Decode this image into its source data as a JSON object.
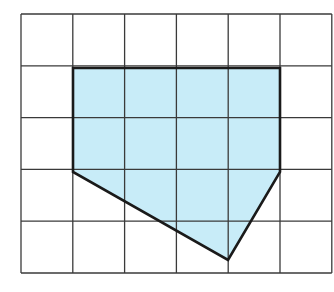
{
  "diagram": {
    "type": "grid-polygon",
    "grid": {
      "columns": 6,
      "rows": 5,
      "origin_px": [
        21,
        14
      ],
      "cell_px": 51.8,
      "line_color": "#3a3a3a",
      "background": "#ffffff"
    },
    "polygon": {
      "fill": "#c8ecf8",
      "stroke": "#1a1a1a",
      "vertices_grid": [
        [
          1,
          1
        ],
        [
          5,
          1
        ],
        [
          5,
          3
        ],
        [
          4,
          4.65
        ],
        [
          1,
          3
        ]
      ],
      "vertices_px": [
        [
          73,
          68
        ],
        [
          280,
          68
        ],
        [
          280,
          172
        ],
        [
          228,
          260
        ],
        [
          73,
          172
        ]
      ]
    }
  }
}
